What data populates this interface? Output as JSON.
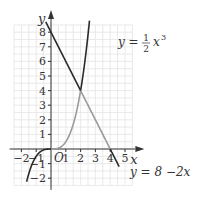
{
  "chart_data": {
    "type": "line",
    "title": "",
    "xlabel": "x",
    "ylabel": "y",
    "origin_label": "O",
    "xlim": [
      -2.5,
      5.5
    ],
    "ylim": [
      -2.5,
      8.5
    ],
    "grid": true,
    "grid_minor_step": 0.5,
    "x_ticks": [
      -2,
      -1,
      1,
      2,
      3,
      4,
      5
    ],
    "x_tick_labels": [
      "−2",
      "−1",
      "1",
      "2",
      "3",
      "4",
      "5"
    ],
    "y_ticks": [
      -2,
      -1,
      1,
      2,
      3,
      4,
      5,
      6,
      7,
      8
    ],
    "y_tick_labels": [
      "−2",
      "−1",
      "1",
      "2",
      "3",
      "4",
      "5",
      "6",
      "7",
      "8"
    ],
    "series": [
      {
        "name": "y = 1/2 x^3",
        "function": "0.5*x^3",
        "domain": [
          -1.65,
          2.6
        ],
        "highlight_domain": [
          0,
          2
        ],
        "label_prefix": "y = ",
        "label_num": "1",
        "label_den": "2",
        "label_var": "x",
        "label_exp": "3"
      },
      {
        "name": "y = 8 − 2x",
        "function": "8-2*x",
        "domain": [
          -0.35,
          4.6
        ],
        "highlight_domain": [
          2,
          4
        ],
        "label": "y = 8 −2x"
      }
    ],
    "intersection": [
      2,
      4
    ],
    "colors": {
      "curve": "#2a2a2a",
      "highlight": "#9a9a9a",
      "grid": "#e4e4e4",
      "axis": "#333333"
    }
  }
}
